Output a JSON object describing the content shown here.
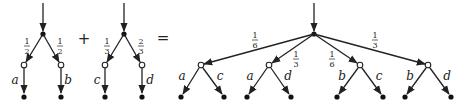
{
  "operators": {
    "plus": "+",
    "equals": "="
  },
  "tree1": {
    "weights": [
      {
        "num": "1",
        "den": "2"
      },
      {
        "num": "1",
        "den": "2"
      }
    ],
    "labels": [
      "a",
      "b"
    ]
  },
  "tree2": {
    "weights": [
      {
        "num": "1",
        "den": "3"
      },
      {
        "num": "2",
        "den": "3"
      }
    ],
    "labels": [
      "c",
      "d"
    ]
  },
  "result": {
    "weights": [
      {
        "num": "1",
        "den": "6"
      },
      {
        "num": "1",
        "den": "3"
      },
      {
        "num": "1",
        "den": "6"
      },
      {
        "num": "1",
        "den": "3"
      }
    ],
    "branches": [
      {
        "labels": [
          "a",
          "c"
        ]
      },
      {
        "labels": [
          "a",
          "d"
        ]
      },
      {
        "labels": [
          "b",
          "c"
        ]
      },
      {
        "labels": [
          "b",
          "d"
        ]
      }
    ]
  }
}
